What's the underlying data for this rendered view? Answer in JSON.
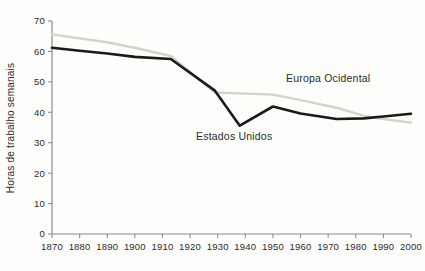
{
  "chart_data": {
    "type": "line",
    "title": "",
    "xlabel": "",
    "ylabel": "Horas de trabalho semanais",
    "xlim": [
      1870,
      2000
    ],
    "ylim": [
      0,
      70
    ],
    "grid": false,
    "legend_position": "inline-annotations",
    "x_ticks": [
      "1870",
      "1880",
      "1890",
      "1900",
      "1910",
      "1920",
      "1930",
      "1940",
      "1950",
      "1960",
      "1970",
      "1980",
      "1990",
      "2000"
    ],
    "y_ticks": [
      "0",
      "10",
      "20",
      "30",
      "40",
      "50",
      "60",
      "70"
    ],
    "series": [
      {
        "name": "Europa Ocidental",
        "color": "#d5d3c8",
        "annotation": "Europa Ocidental",
        "x": [
          1870,
          1880,
          1890,
          1900,
          1913,
          1929,
          1938,
          1950,
          1960,
          1973,
          1983,
          1990,
          2000
        ],
        "values": [
          65.6,
          64.3,
          63.0,
          61.2,
          58.5,
          46.5,
          46.2,
          45.8,
          44.0,
          41.5,
          38.8,
          37.8,
          36.6
        ]
      },
      {
        "name": "Estados Unidos",
        "color": "#1a1a1a",
        "annotation": "Estados Unidos",
        "x": [
          1870,
          1880,
          1890,
          1900,
          1913,
          1929,
          1938,
          1950,
          1960,
          1973,
          1983,
          1990,
          2000
        ],
        "values": [
          61.2,
          60.2,
          59.3,
          58.2,
          57.5,
          47.1,
          35.6,
          41.9,
          39.6,
          37.8,
          38.0,
          38.6,
          39.5
        ]
      }
    ],
    "annotations": [
      {
        "text": "Europa Ocidental",
        "x_px": 286,
        "y_px": 82
      },
      {
        "text": "Estados Unidos",
        "x_px": 196,
        "y_px": 140
      }
    ]
  }
}
